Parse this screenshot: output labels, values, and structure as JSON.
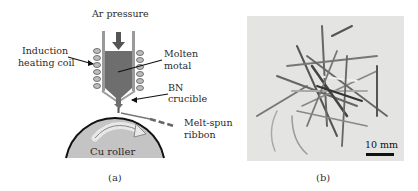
{
  "figure": {
    "panel_a": {
      "caption": "(a)",
      "labels": {
        "ar_pressure": "Ar pressure",
        "induction_line1": "Induction",
        "induction_line2": "heating coil",
        "molten_line1": "Molten",
        "molten_line2": "motal",
        "bn_line1": "BN",
        "bn_line2": "crucible",
        "ribbon_line1": "Melt-spun",
        "ribbon_line2": "ribbon",
        "roller": "Cu roller"
      },
      "colors": {
        "crucible_fill": "#6e6e6e",
        "crucible_wall": "#9a9a9a",
        "roller_fill": "#c4c4c4",
        "roller_edge": "#111111",
        "arrow": "#555555"
      }
    },
    "panel_b": {
      "caption": "(b)",
      "scale_label": "10 mm",
      "photo_bg": "#e4e4e2"
    }
  }
}
